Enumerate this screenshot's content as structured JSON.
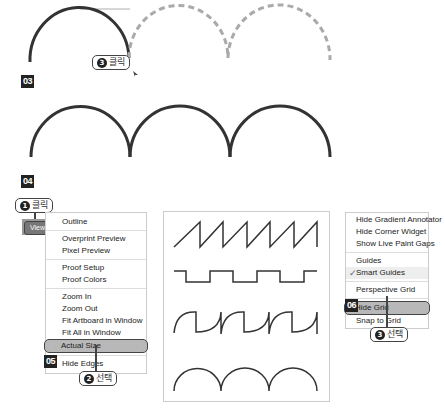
{
  "steps": {
    "s03": "03",
    "s04": "04",
    "s05": "05",
    "s06": "06"
  },
  "callouts": {
    "click3": {
      "num": "3",
      "label": "클릭"
    },
    "click1": {
      "num": "1",
      "label": "클릭"
    },
    "select2": {
      "num": "2",
      "label": "선택"
    },
    "select3": {
      "num": "3",
      "label": "선택"
    }
  },
  "view_button": {
    "label": "View"
  },
  "view_menu": {
    "items": [
      {
        "label": "Outline"
      },
      {
        "label": "Overprint Preview"
      },
      {
        "label": "Pixel Preview"
      },
      {
        "label": "Proof Setup"
      },
      {
        "label": "Proof Colors"
      },
      {
        "label": "Zoom In"
      },
      {
        "label": "Zoom Out"
      },
      {
        "label": "Fit Artboard in Window"
      },
      {
        "label": "Fit All in Window"
      },
      {
        "label": "Actual Size",
        "highlighted": true
      },
      {
        "label": "Hide Edges"
      }
    ]
  },
  "guides_menu": {
    "items": [
      {
        "label": "Hide Gradient Annotator"
      },
      {
        "label": "Hide Corner Widget"
      },
      {
        "label": "Show Live Paint Gaps"
      },
      {
        "label": "Guides"
      },
      {
        "label": "Smart Guides",
        "checked": true
      },
      {
        "label": "Perspective Grid"
      },
      {
        "label": "Hide Grid",
        "highlighted": true
      },
      {
        "label": "Snap to Grid"
      }
    ]
  },
  "colors": {
    "stroke": "#333333",
    "dashed": "#aaaaaa",
    "highlight": "#b8b8b8"
  }
}
